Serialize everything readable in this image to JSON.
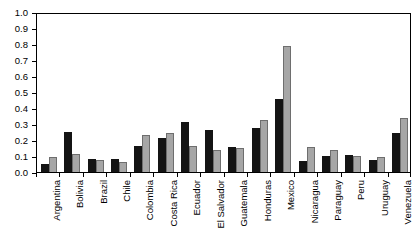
{
  "chart_data": {
    "type": "bar",
    "title": "",
    "subtitle": "",
    "xlabel": "",
    "ylabel": "",
    "ylim": [
      0.0,
      1.0
    ],
    "ytick_labels": [
      "0.0",
      "0.1",
      "0.2",
      "0.3",
      "0.4",
      "0.5",
      "0.6",
      "0.7",
      "0.8",
      "0.9",
      "1.0"
    ],
    "ytick_values": [
      0.0,
      0.1,
      0.2,
      0.3,
      0.4,
      0.5,
      0.6,
      0.7,
      0.8,
      0.9,
      1.0
    ],
    "grid": false,
    "legend": "none",
    "orientation": "vertical",
    "categories": [
      "Argentina",
      "Bolivia",
      "Brazil",
      "Chile",
      "Colombia",
      "Costa Rica",
      "Ecuador",
      "El Salvador",
      "Guatemala",
      "Honduras",
      "Mexico",
      "Nicaragua",
      "Paraguay",
      "Peru",
      "Uruguay",
      "Venezuela"
    ],
    "series": [
      {
        "name": "Series 1",
        "color": "#141414",
        "values": [
          0.05,
          0.25,
          0.08,
          0.08,
          0.16,
          0.21,
          0.315,
          0.26,
          0.155,
          0.275,
          0.455,
          0.07,
          0.1,
          0.105,
          0.075,
          0.245
        ]
      },
      {
        "name": "Series 2",
        "color": "#a6a6a6",
        "values": [
          0.095,
          0.115,
          0.075,
          0.065,
          0.23,
          0.245,
          0.16,
          0.14,
          0.15,
          0.325,
          0.79,
          0.155,
          0.135,
          0.1,
          0.095,
          0.335
        ]
      }
    ]
  }
}
